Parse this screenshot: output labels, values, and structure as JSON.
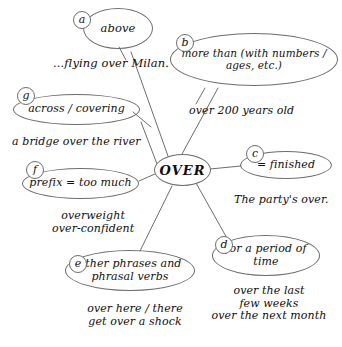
{
  "diagram": {
    "title": "OVER",
    "center": {
      "label": "OVER"
    },
    "stroke_color": "#6d6d6d",
    "text_color": "#12100e",
    "nodes": [
      {
        "key": "a",
        "badge": "a",
        "label": "above"
      },
      {
        "key": "b",
        "badge": "b",
        "label": "more than (with\nnumbers / ages, etc.)"
      },
      {
        "key": "c",
        "badge": "c",
        "label": "= finished"
      },
      {
        "key": "d",
        "badge": "d",
        "label": "for a\nperiod of time"
      },
      {
        "key": "e",
        "badge": "e",
        "label": "other phrases and\nphrasal verbs"
      },
      {
        "key": "f",
        "badge": "f",
        "label": "prefix = too much"
      },
      {
        "key": "g",
        "badge": "g",
        "label": "across / covering"
      }
    ],
    "examples": [
      {
        "key": "a",
        "text": "...flying over Milan."
      },
      {
        "key": "b",
        "text": "over 200 years old"
      },
      {
        "key": "g",
        "text": "a bridge over the river"
      },
      {
        "key": "f",
        "text": "overweight\nover-confident"
      },
      {
        "key": "c",
        "text": "The party's over."
      },
      {
        "key": "d",
        "text": "over the last\nfew weeks\nover the next month"
      },
      {
        "key": "e",
        "text": "over here / there\nget over a shock"
      }
    ]
  }
}
